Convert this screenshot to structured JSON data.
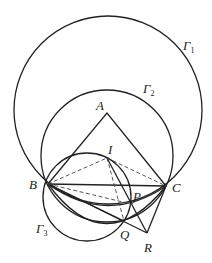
{
  "diagram": {
    "points": {
      "A": {
        "label": "A",
        "x": 107,
        "y": 113
      },
      "B": {
        "label": "B",
        "x": 48,
        "y": 184
      },
      "C": {
        "label": "C",
        "x": 166,
        "y": 186
      },
      "I": {
        "label": "I",
        "x": 107,
        "y": 158
      },
      "P": {
        "label": "P",
        "x": 131,
        "y": 204
      },
      "Q": {
        "label": "Q",
        "x": 124,
        "y": 221
      },
      "R": {
        "label": "R",
        "x": 147,
        "y": 233
      }
    },
    "circles": {
      "gamma1": {
        "label": "Γ",
        "sub": "1"
      },
      "gamma2": {
        "label": "Γ",
        "sub": "2"
      },
      "gamma3": {
        "label": "Γ",
        "sub": "3"
      }
    }
  }
}
